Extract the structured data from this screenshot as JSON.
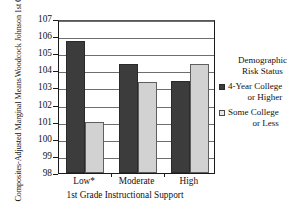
{
  "chart_data": {
    "type": "bar",
    "title": "",
    "xlabel": "1st Grade Instructional Support",
    "ylabel_line1": "Woodcock Johnson 1st Grade",
    "ylabel_line2": "Composites-Adjusted Marginal Means",
    "categories": [
      "Low*",
      "Moderate",
      "High"
    ],
    "series": [
      {
        "name": "4-Year College or Higher",
        "name_line1": "4-Year College",
        "name_line2": "or Higher",
        "color": "#3c3c3c",
        "values": [
          105.7,
          104.4,
          103.4
        ]
      },
      {
        "name": "Some College or Less",
        "name_line1": "Some College",
        "name_line2": "or Less",
        "color": "#d2d2d2",
        "values": [
          101.0,
          103.3,
          104.4
        ]
      }
    ],
    "ylim": [
      98,
      107
    ],
    "yticks": [
      98,
      99,
      100,
      101,
      102,
      103,
      104,
      105,
      106,
      107
    ],
    "ytick_labels": [
      "98",
      "99",
      "100",
      "101",
      "102",
      "103",
      "104",
      "105",
      "106",
      "107"
    ],
    "grid": true,
    "legend_position": "right",
    "legend_title_line1": "Demographic",
    "legend_title_line2": "Risk Status"
  }
}
